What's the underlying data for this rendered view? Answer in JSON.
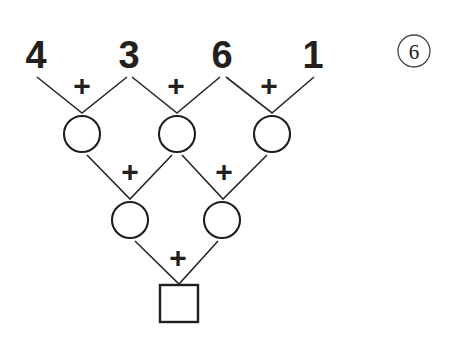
{
  "worksheet": {
    "problem_number": "6",
    "operator": "+",
    "top_row": [
      {
        "value": "4"
      },
      {
        "value": "3"
      },
      {
        "value": "6"
      },
      {
        "value": "1"
      }
    ],
    "row2_blanks": [
      {
        "value": ""
      },
      {
        "value": ""
      },
      {
        "value": ""
      }
    ],
    "row3_blanks": [
      {
        "value": ""
      },
      {
        "value": ""
      }
    ],
    "answer_blank": {
      "value": ""
    },
    "operators_row1": [
      "+",
      "+",
      "+"
    ],
    "operators_row2": [
      "+",
      "+"
    ],
    "operators_row3": [
      "+"
    ],
    "colors": {
      "ink": "#231f1c",
      "line": "#2b2724",
      "shape_outline": "#211d1a",
      "badge_outline": "#4a4642",
      "background": "#ffffff"
    }
  }
}
